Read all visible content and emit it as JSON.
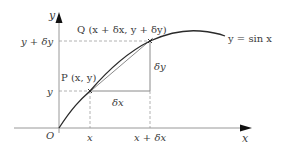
{
  "diagram": {
    "type": "function-graph",
    "title": "",
    "curve_label": "y = sin x",
    "axes": {
      "x_label": "x",
      "y_label": "y",
      "origin_label": "O"
    },
    "points": {
      "P": {
        "label": "P (x, y)"
      },
      "Q": {
        "label": "Q (x + δx, y + δy)"
      }
    },
    "increments": {
      "dx_label": "δx",
      "dy_label": "δy"
    },
    "ticks": {
      "x": [
        "x",
        "x + δx"
      ],
      "y": [
        "y",
        "y + δy"
      ]
    },
    "colors": {
      "curve": "#2a2a2a",
      "chord": "#8a8a8a",
      "axes": "#8c8c8c",
      "dashed": "#a0a0a0",
      "text": "#3a3a3a"
    }
  }
}
